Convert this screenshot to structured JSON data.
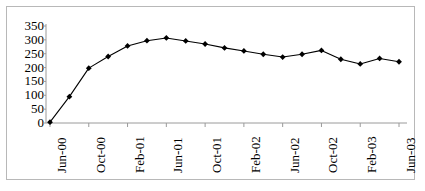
{
  "chart_data": {
    "type": "line",
    "title": "",
    "subtitle": "",
    "xlabel": "",
    "ylabel": "",
    "grid": false,
    "legend": "none",
    "marker": "diamond",
    "line_color": "#000000",
    "marker_color": "#000000",
    "background_color": "#ffffff",
    "border_color": "#b8b8b8",
    "ylim": [
      0,
      350
    ],
    "yticks": [
      0,
      50,
      100,
      150,
      200,
      250,
      300,
      350
    ],
    "ytick_labels": [
      "350",
      "300",
      "250",
      "200",
      "150",
      "100",
      "50",
      "0"
    ],
    "xtick_labels": [
      "Jun-00",
      "Oct-00",
      "Feb-01",
      "Jun-01",
      "Oct-01",
      "Feb-02",
      "Jun-02",
      "Oct-02",
      "Feb-03",
      "Jun-03"
    ],
    "xtick_rotation_deg": 90,
    "x_interval_months": 2,
    "x": [
      "Jun-00",
      "Aug-00",
      "Oct-00",
      "Dec-00",
      "Feb-01",
      "Apr-01",
      "Jun-01",
      "Aug-01",
      "Oct-01",
      "Dec-01",
      "Feb-02",
      "Apr-02",
      "Jun-02",
      "Aug-02",
      "Oct-02",
      "Dec-02",
      "Feb-03",
      "Apr-03",
      "Jun-03"
    ],
    "values": [
      3,
      95,
      198,
      240,
      278,
      297,
      307,
      296,
      285,
      271,
      260,
      248,
      238,
      248,
      262,
      230,
      213,
      233,
      221
    ],
    "series": [
      {
        "name": "series-1",
        "values": [
          3,
          95,
          198,
          240,
          278,
          297,
          307,
          296,
          285,
          271,
          260,
          248,
          238,
          248,
          262,
          230,
          213,
          233,
          221
        ]
      }
    ]
  },
  "axis": {
    "y_label_0": "0",
    "y_label_50": "50",
    "y_label_100": "100",
    "y_label_150": "150",
    "y_label_200": "200",
    "y_label_250": "250",
    "y_label_300": "300",
    "y_label_350": "350"
  }
}
